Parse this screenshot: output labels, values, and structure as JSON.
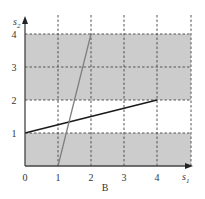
{
  "chart_data": {
    "type": "line",
    "title": "",
    "caption": "B",
    "xlabel": "s",
    "xlabel_sub": "1",
    "ylabel": "s",
    "ylabel_sub": "2",
    "xlim": [
      0,
      4.35
    ],
    "ylim": [
      0,
      4
    ],
    "x_ticks": [
      "0",
      "1",
      "2",
      "3",
      "4"
    ],
    "y_ticks": [
      "1",
      "2",
      "3",
      "4"
    ],
    "grid": true,
    "grid_style": "dashed",
    "shaded_bands": [
      {
        "y_from": 0,
        "y_to": 1,
        "color": "#cccccc"
      },
      {
        "y_from": 2,
        "y_to": 4,
        "color": "#cccccc"
      }
    ],
    "series": [
      {
        "name": "black-line",
        "color": "#1a1a1a",
        "points": [
          [
            0,
            1
          ],
          [
            4,
            2
          ]
        ]
      },
      {
        "name": "gray-line",
        "color": "#7f7f7f",
        "points": [
          [
            1,
            0
          ],
          [
            2,
            4
          ]
        ]
      }
    ]
  }
}
